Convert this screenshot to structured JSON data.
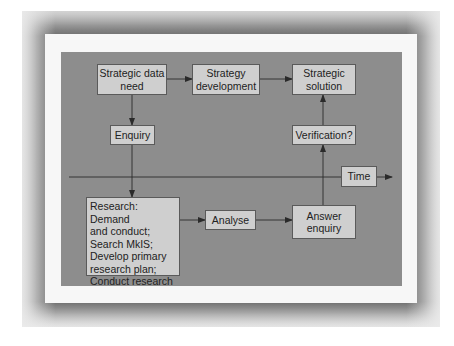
{
  "diagram": {
    "colors": {
      "frame": "#6e6e6e",
      "panel": "#f7f7f7",
      "background": "#8d8d8d",
      "box_fill": "#cfcfcf",
      "line": "#2a2a2a"
    },
    "nodes": {
      "strategic_data_need": "Strategic data\nneed",
      "strategy_development": "Strategy\ndevelopment",
      "strategic_solution": "Strategic\nsolution",
      "enquiry": "Enquiry",
      "verification": "Verification?",
      "time": "Time",
      "research": "Research: Demand\nand conduct;\nSearch MkIS;\nDevelop primary\nresearch plan;\nConduct research",
      "analyse": "Analyse",
      "answer_enquiry": "Answer\nenquiry"
    },
    "edges": [
      {
        "from": "Strategic data need",
        "to": "Strategy development"
      },
      {
        "from": "Strategy development",
        "to": "Strategic solution"
      },
      {
        "from": "Strategic data need",
        "to": "Enquiry"
      },
      {
        "from": "Enquiry",
        "to": "Research"
      },
      {
        "from": "Research",
        "to": "Analyse"
      },
      {
        "from": "Analyse",
        "to": "Answer enquiry"
      },
      {
        "from": "Answer enquiry",
        "to": "Verification?"
      },
      {
        "from": "Verification?",
        "to": "Strategic solution"
      }
    ],
    "axis": {
      "label": "Time"
    }
  }
}
